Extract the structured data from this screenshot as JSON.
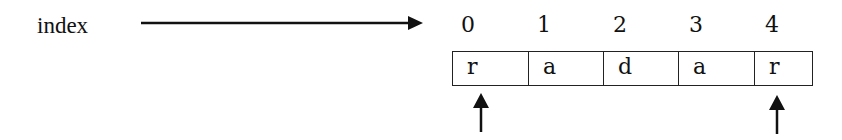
{
  "diagram": {
    "label": "index",
    "indices": [
      "0",
      "1",
      "2",
      "3",
      "4"
    ],
    "cells": [
      "r",
      "a",
      "d",
      "a",
      "r"
    ],
    "pointers": [
      {
        "at_index": 0
      },
      {
        "at_index": 4
      }
    ]
  }
}
